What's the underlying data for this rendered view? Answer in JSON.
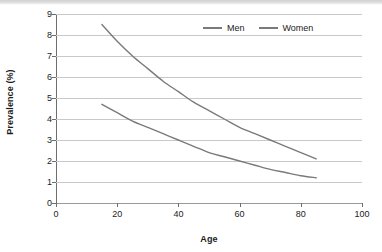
{
  "chart_data": {
    "type": "line",
    "title": "",
    "xlabel": "Age",
    "ylabel": "Prevalence (%)",
    "xlim": [
      0,
      100
    ],
    "ylim": [
      0,
      9
    ],
    "xticks": [
      0,
      20,
      40,
      60,
      80,
      100
    ],
    "yticks": [
      0,
      1,
      2,
      3,
      4,
      5,
      6,
      7,
      8,
      9
    ],
    "grid": true,
    "legend_position": "top-right",
    "series": [
      {
        "name": "Men",
        "color": "#7a7a7a",
        "x": [
          15,
          20,
          25,
          30,
          35,
          40,
          45,
          50,
          55,
          60,
          65,
          70,
          75,
          80,
          85
        ],
        "values": [
          8.5,
          7.7,
          7.0,
          6.4,
          5.8,
          5.3,
          4.8,
          4.4,
          4.0,
          3.6,
          3.3,
          3.0,
          2.7,
          2.4,
          2.1
        ]
      },
      {
        "name": "Women",
        "color": "#7a7a7a",
        "x": [
          15,
          20,
          25,
          30,
          35,
          40,
          45,
          50,
          55,
          60,
          65,
          70,
          75,
          80,
          85
        ],
        "values": [
          4.7,
          4.3,
          3.9,
          3.6,
          3.3,
          3.0,
          2.7,
          2.4,
          2.2,
          2.0,
          1.8,
          1.6,
          1.45,
          1.3,
          1.2
        ]
      }
    ]
  },
  "legend": {
    "items": [
      {
        "label": "Men"
      },
      {
        "label": "Women"
      }
    ]
  },
  "colors": {
    "gridline": "#c9c9c9",
    "axis": "#6e6e6e",
    "text": "#1c1c1c",
    "series": "#7a7a7a"
  }
}
